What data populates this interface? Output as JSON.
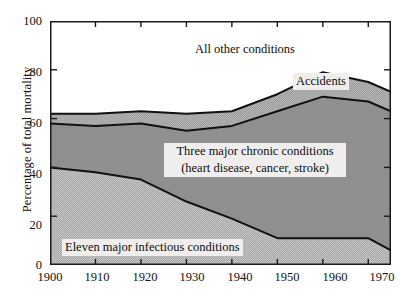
{
  "chart_data": {
    "type": "area",
    "title": "",
    "xlabel": "",
    "ylabel": "Percentage of total mortality",
    "xlim": [
      1900,
      1975
    ],
    "ylim": [
      0,
      100
    ],
    "xticks": [
      1900,
      1910,
      1920,
      1930,
      1940,
      1950,
      1960,
      1970
    ],
    "xtick_labels": [
      "1900",
      "1910",
      "1920",
      "1930",
      "1940",
      "1950",
      "1960",
      "1970"
    ],
    "yticks": [
      0,
      20,
      40,
      60,
      80,
      100
    ],
    "ytick_labels": [
      "0",
      "20",
      "40",
      "60",
      "80",
      "100"
    ],
    "grid": false,
    "legend_position": "inline-annotations",
    "stacked": true,
    "x": [
      1900,
      1910,
      1920,
      1930,
      1940,
      1950,
      1960,
      1970,
      1975
    ],
    "series": [
      {
        "name": "Eleven major infectious conditions",
        "values": [
          40,
          38,
          35,
          26,
          19,
          11,
          11,
          11,
          6
        ],
        "fill": "#b9b9b9"
      },
      {
        "name": "Three major chronic conditions (heart disease, cancer, stroke)",
        "values": [
          18,
          19,
          23,
          29,
          38,
          52,
          58,
          56,
          57
        ],
        "fill": "#8f8f8f"
      },
      {
        "name": "Accidents",
        "values": [
          4,
          5,
          5,
          7,
          6,
          7,
          10,
          8,
          8
        ],
        "fill": "#a8a8a8"
      },
      {
        "name": "All other conditions",
        "values": [
          38,
          38,
          37,
          38,
          37,
          30,
          21,
          25,
          29
        ],
        "fill": "#ffffff"
      }
    ],
    "boundaries": {
      "note": "cumulative upper edges of stacked bands",
      "infectious_top": [
        40,
        38,
        35,
        26,
        19,
        11,
        11,
        11,
        6
      ],
      "chronic_top": [
        58,
        57,
        58,
        55,
        57,
        63,
        69,
        67,
        63
      ],
      "accidents_top": [
        62,
        62,
        63,
        62,
        63,
        70,
        79,
        75,
        71
      ]
    },
    "annotations": [
      {
        "text": "All other conditions",
        "x": 1915,
        "y": 90
      },
      {
        "text": "Accidents",
        "x": 1958,
        "y": 74
      },
      {
        "text": "Three major chronic conditions",
        "x": 1938,
        "y": 44
      },
      {
        "text": "(heart disease, cancer, stroke)",
        "x": 1938,
        "y": 38
      },
      {
        "text": "Eleven major infectious conditions",
        "x": 1928,
        "y": 8
      }
    ]
  },
  "labels": {
    "y_axis_title": "Percentage of total mortality",
    "all_other": "All other conditions",
    "accidents": "Accidents",
    "chronic_line1": "Three major chronic conditions",
    "chronic_line2": "(heart disease, cancer, stroke)",
    "infectious": "Eleven major infectious conditions"
  },
  "colors": {
    "infectious_fill": "#b9b9b9",
    "chronic_fill": "#8f8f8f",
    "accidents_fill": "#a8a8a8",
    "other_fill": "#ffffff",
    "axis": "#1a1a1a",
    "curve": "#111111",
    "label_box": "#efeeec"
  }
}
